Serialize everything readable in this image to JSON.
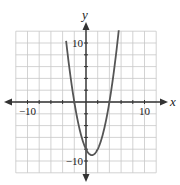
{
  "chart_data": {
    "type": "line",
    "title": "",
    "xlabel": "x",
    "ylabel": "y",
    "xlim": [
      -12,
      12
    ],
    "ylim": [
      -12,
      12
    ],
    "grid": true,
    "grid_step": 2,
    "tick_labels": {
      "x": [
        {
          "value": -10,
          "label": "−10"
        },
        {
          "value": 10,
          "label": "10"
        }
      ],
      "y": [
        {
          "value": 10,
          "label": "10"
        },
        {
          "value": -10,
          "label": "−10"
        }
      ]
    },
    "series": [
      {
        "name": "parabola",
        "equation": "y = x^2 - 2x - 8",
        "vertex": [
          1,
          -9
        ],
        "roots": [
          -2,
          4
        ],
        "x": [
          -3.4,
          -3,
          -2,
          -1,
          0,
          1,
          2,
          3,
          4,
          5,
          5.6
        ],
        "y": [
          11.4,
          7,
          0,
          -5,
          -8,
          -9,
          -8,
          -5,
          0,
          7,
          12.2
        ],
        "color": "#555555"
      }
    ]
  }
}
